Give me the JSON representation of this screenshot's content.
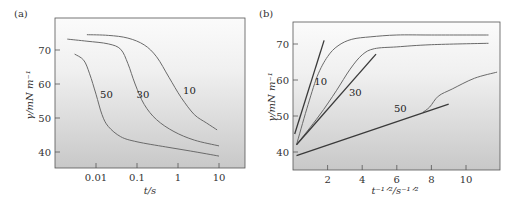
{
  "chart_data": [
    {
      "panel": "(a)",
      "type": "line",
      "title": "",
      "xlabel": "t/s",
      "ylabel": "γ/mN m⁻¹",
      "xscale": "log",
      "xlim": [
        0.001,
        30
      ],
      "ylim": [
        35,
        77
      ],
      "xticks": [
        0.01,
        0.1,
        1,
        10
      ],
      "xtick_labels": [
        "0.01",
        "0.1",
        "1",
        "10"
      ],
      "yticks": [
        40,
        50,
        60,
        70
      ],
      "ytick_labels": [
        "40",
        "50",
        "60",
        "70"
      ],
      "grid": false,
      "legend": "none (inline curve labels)",
      "series": [
        {
          "name": "10",
          "label_pos": [
            1.9,
            57
          ],
          "points": [
            [
              0.006,
              74.5
            ],
            [
              0.02,
              74.3
            ],
            [
              0.06,
              73.5
            ],
            [
              0.15,
              71.5
            ],
            [
              0.3,
              68
            ],
            [
              0.6,
              62
            ],
            [
              1.2,
              56
            ],
            [
              2.5,
              51
            ],
            [
              5,
              48.5
            ],
            [
              9,
              46.5
            ]
          ]
        },
        {
          "name": "30",
          "label_pos": [
            0.14,
            56
          ],
          "points": [
            [
              0.002,
              73.2
            ],
            [
              0.006,
              72.6
            ],
            [
              0.02,
              71.8
            ],
            [
              0.04,
              70.2
            ],
            [
              0.06,
              66
            ],
            [
              0.09,
              60
            ],
            [
              0.15,
              54
            ],
            [
              0.3,
              49.5
            ],
            [
              0.8,
              46
            ],
            [
              2.5,
              43.5
            ],
            [
              10,
              41.8
            ]
          ]
        },
        {
          "name": "50",
          "label_pos": [
            0.018,
            56
          ],
          "points": [
            [
              0.003,
              68.8
            ],
            [
              0.005,
              67
            ],
            [
              0.007,
              63
            ],
            [
              0.01,
              57
            ],
            [
              0.014,
              51
            ],
            [
              0.02,
              47.5
            ],
            [
              0.04,
              44.5
            ],
            [
              0.1,
              43
            ],
            [
              0.5,
              41.5
            ],
            [
              2,
              40.3
            ],
            [
              10,
              38.8
            ]
          ]
        }
      ]
    },
    {
      "panel": "(b)",
      "type": "line",
      "title": "",
      "xlabel": "t⁻¹ᐟ²/s⁻¹ᐟ²",
      "ylabel": "γ/mN m⁻¹",
      "xscale": "linear",
      "xlim": [
        0,
        11.8
      ],
      "ylim": [
        35,
        77
      ],
      "xticks": [
        2,
        4,
        6,
        8,
        10
      ],
      "xtick_labels": [
        "2",
        "4",
        "6",
        "8",
        "10"
      ],
      "yticks": [
        40,
        50,
        60,
        70
      ],
      "ytick_labels": [
        "40",
        "50",
        "60",
        "70"
      ],
      "grid": false,
      "legend": "none (inline curve labels)",
      "series": [
        {
          "name": "10",
          "kind": "data",
          "label_pos": [
            1.6,
            58.5
          ],
          "points": [
            [
              0.2,
              42
            ],
            [
              0.8,
              52
            ],
            [
              1.4,
              61
            ],
            [
              2.0,
              66.5
            ],
            [
              2.6,
              69.5
            ],
            [
              3.4,
              71.3
            ],
            [
              4.5,
              72
            ],
            [
              6,
              72.5
            ],
            [
              8,
              72.5
            ],
            [
              11.3,
              72.5
            ]
          ]
        },
        {
          "name": "10 fit",
          "kind": "tangent",
          "points": [
            [
              0.1,
              45
            ],
            [
              1.8,
              71
            ]
          ]
        },
        {
          "name": "30",
          "kind": "data",
          "label_pos": [
            3.6,
            55.5
          ],
          "points": [
            [
              0.2,
              42
            ],
            [
              1.5,
              50
            ],
            [
              2.5,
              57
            ],
            [
              3.3,
              63
            ],
            [
              4.0,
              67
            ],
            [
              4.7,
              68.7
            ],
            [
              6,
              69.2
            ],
            [
              8,
              69.8
            ],
            [
              11.3,
              70.2
            ]
          ]
        },
        {
          "name": "30 fit",
          "kind": "tangent",
          "points": [
            [
              0.2,
              42
            ],
            [
              4.8,
              67.2
            ]
          ]
        },
        {
          "name": "50",
          "kind": "data",
          "label_pos": [
            6.2,
            51
          ],
          "points": [
            [
              7.5,
              51
            ],
            [
              7.9,
              52.5
            ],
            [
              8.4,
              55.5
            ],
            [
              9.2,
              57.5
            ],
            [
              10.5,
              60.5
            ],
            [
              11.8,
              62.2
            ]
          ]
        },
        {
          "name": "50 fit",
          "kind": "tangent",
          "points": [
            [
              0.2,
              39
            ],
            [
              9.0,
              53.3
            ]
          ]
        }
      ]
    }
  ],
  "panels": {
    "a": {
      "label": "(a)",
      "box": {
        "x0": 55,
        "y0": 18,
        "x1": 245,
        "y1": 168
      },
      "xlabel": "t/s",
      "ylabel": "γ/mN m⁻¹"
    },
    "b": {
      "label": "(b)",
      "box": {
        "x0": 293,
        "y0": 22,
        "x1": 500,
        "y1": 170
      },
      "xlabel": "t⁻¹ᐟ²/s⁻¹ᐟ²",
      "ylabel": "γ/mN m⁻¹"
    }
  },
  "colors": {
    "axis": "#555555",
    "curve": "#6a6a6a",
    "fit_line": "#3a3a3a",
    "bg_top": "#fafafa",
    "bg_bottom": "#c9c9c9"
  }
}
